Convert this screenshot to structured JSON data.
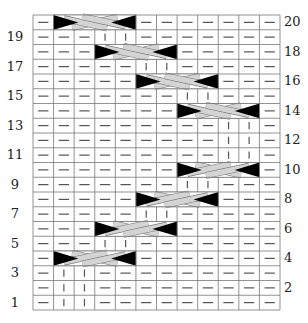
{
  "chart_data": {
    "type": "knitting-cable-chart",
    "columns": 12,
    "rows": 20,
    "legend_symbols": {
      "-": "purl (horizontal dash)",
      "|": "knit (vertical bar)",
      "C": "cable cross spanning 4 stitches"
    },
    "row_labels_left": [
      "1",
      "3",
      "5",
      "7",
      "9",
      "11",
      "13",
      "15",
      "17",
      "19"
    ],
    "row_labels_right": [
      "2",
      "4",
      "6",
      "8",
      "10",
      "12",
      "14",
      "16",
      "18",
      "20"
    ],
    "grid": {
      "1": "-||---------",
      "2": "-||---------",
      "3": "-||---------",
      "4": "-CCCC-------",
      "5": "---||-------",
      "6": "---CCCC-----",
      "7": "-----||-----",
      "8": "-----CCCC---",
      "9": "-------||---",
      "10": "-------CCCC-",
      "11": "---------||-",
      "12": "---------||-",
      "13": "---------||-",
      "14": "-------CCCC-",
      "15": "-------||---",
      "16": "-----CCCC---",
      "17": "-----||-----",
      "18": "---CCCC-----",
      "19": "---||-------",
      "20": "-CCCC-------"
    },
    "cables": [
      {
        "row": 4,
        "start_col": 2,
        "width": 4,
        "front_band": "up-right"
      },
      {
        "row": 6,
        "start_col": 4,
        "width": 4,
        "front_band": "up-right"
      },
      {
        "row": 8,
        "start_col": 6,
        "width": 4,
        "front_band": "up-right"
      },
      {
        "row": 10,
        "start_col": 8,
        "width": 4,
        "front_band": "up-right"
      },
      {
        "row": 14,
        "start_col": 8,
        "width": 4,
        "front_band": "down-right"
      },
      {
        "row": 16,
        "start_col": 6,
        "width": 4,
        "front_band": "down-right"
      },
      {
        "row": 18,
        "start_col": 4,
        "width": 4,
        "front_band": "down-right"
      },
      {
        "row": 20,
        "start_col": 2,
        "width": 4,
        "front_band": "down-right"
      }
    ]
  },
  "colors": {
    "grid_line": "#777777",
    "symbol": "#555555",
    "cable_band": "#d4d4d4",
    "cable_triangle": "#000000",
    "background": "#ffffff"
  }
}
